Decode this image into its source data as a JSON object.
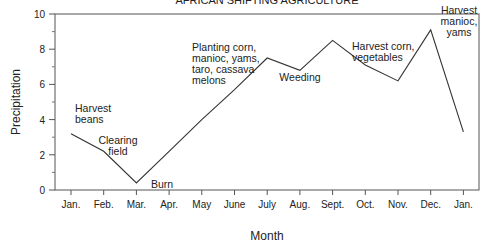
{
  "chart_data": {
    "type": "line",
    "title": "AFRICAN SHIFTING AGRICULTURE",
    "xlabel": "Month",
    "ylabel": "Precipitation",
    "ylim": [
      0,
      10
    ],
    "yticks": [
      0,
      2,
      4,
      6,
      8,
      10
    ],
    "grid": false,
    "categories": [
      "Jan.",
      "Feb.",
      "Mar.",
      "Apr.",
      "May",
      "June",
      "July",
      "Aug.",
      "Sept.",
      "Oct.",
      "Nov.",
      "Dec.",
      "Jan."
    ],
    "series": [
      {
        "name": "Precipitation",
        "values": [
          3.2,
          2.2,
          0.4,
          2.2,
          4.0,
          5.7,
          7.5,
          6.8,
          8.5,
          7.1,
          6.2,
          9.1,
          3.3
        ]
      }
    ],
    "annotations": [
      {
        "index": 0,
        "lines": [
          "Harvest",
          "beans"
        ]
      },
      {
        "index": 1,
        "lines": [
          "Clearing",
          "field"
        ]
      },
      {
        "index": 2,
        "lines": [
          "Burn"
        ]
      },
      {
        "index": 5,
        "lines": [
          "Planting corn,",
          "manioc, yams,",
          "taro, cassava",
          "melons"
        ]
      },
      {
        "index": 7,
        "lines": [
          "Weeding"
        ]
      },
      {
        "index": 9,
        "lines": [
          "Harvest corn,",
          "vegetables"
        ]
      },
      {
        "index": 11,
        "lines": [
          "Harvest",
          "manioc,",
          "yams"
        ]
      }
    ]
  }
}
